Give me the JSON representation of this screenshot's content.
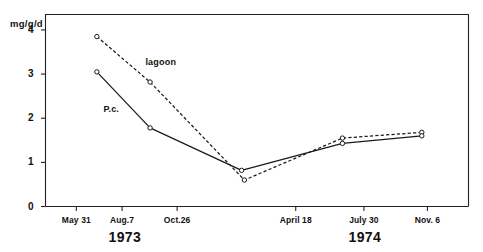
{
  "chart_data": {
    "type": "line",
    "title": "",
    "xlabel": "",
    "ylabel": "mg/g/d",
    "ylim": [
      0,
      4.35
    ],
    "yticks": [
      0,
      1,
      2,
      3,
      4
    ],
    "ytick_labels": [
      "0",
      "1",
      "2",
      "3",
      "4"
    ],
    "x": [
      0,
      1,
      2,
      3,
      4,
      5
    ],
    "xtick_labels": [
      "May 31",
      "Aug.7",
      "Oct.26",
      "April 18",
      "July 30",
      "Nov. 6"
    ],
    "xtick_positions": [
      0.33,
      0.82,
      1.41,
      2.68,
      3.41,
      4.09
    ],
    "grid": false,
    "legend_position": "inline-annotations",
    "period_labels": [
      {
        "text": "1973",
        "x": 0.85
      },
      {
        "text": "1974",
        "x": 3.42
      }
    ],
    "series": [
      {
        "name": "lagoon",
        "style": "dashed",
        "marker": "open-circle",
        "annotation": "lagoon",
        "annotation_x": 1.07,
        "annotation_y": 3.25,
        "points": [
          {
            "x": 0.55,
            "y": 3.85
          },
          {
            "x": 1.12,
            "y": 2.82
          },
          {
            "x": 2.13,
            "y": 0.6
          },
          {
            "x": 3.18,
            "y": 1.55
          },
          {
            "x": 4.03,
            "y": 1.68
          }
        ]
      },
      {
        "name": "P.c.",
        "style": "solid",
        "marker": "open-circle",
        "annotation": "P.c.",
        "annotation_x": 0.62,
        "annotation_y": 2.18,
        "points": [
          {
            "x": 0.55,
            "y": 3.05
          },
          {
            "x": 1.12,
            "y": 1.78
          },
          {
            "x": 2.1,
            "y": 0.82
          },
          {
            "x": 3.18,
            "y": 1.43
          },
          {
            "x": 4.03,
            "y": 1.6
          }
        ]
      }
    ]
  }
}
